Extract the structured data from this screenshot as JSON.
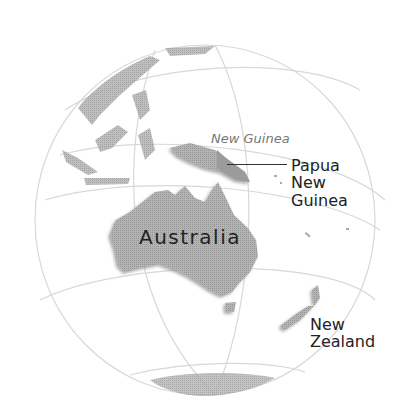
{
  "map": {
    "projection": "orthographic globe",
    "colors": {
      "land": "#a8a8a8",
      "land_highlight": "#9a9a9a",
      "graticule": "#d6d6d6",
      "label": "#222222",
      "label_italic": "#777777"
    },
    "labels": {
      "new_guinea": "New Guinea",
      "papua_new_guinea": [
        "Papua",
        "New",
        "Guinea"
      ],
      "australia": "Australia",
      "new_zealand": [
        "New",
        "Zealand"
      ]
    }
  }
}
